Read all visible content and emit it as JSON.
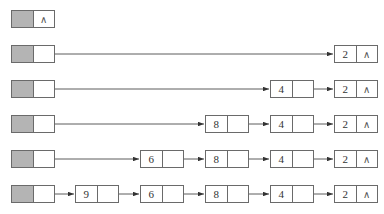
{
  "diagram": {
    "type": "linked-list-insertion-sequence",
    "null_symbol": "∧",
    "colors": {
      "head_fill": "#b4b4b4",
      "border": "#6a6a6a",
      "arrow": "#333333"
    },
    "rows": [
      {
        "nodes": []
      },
      {
        "nodes": [
          "2"
        ]
      },
      {
        "nodes": [
          "4",
          "2"
        ]
      },
      {
        "nodes": [
          "8",
          "4",
          "2"
        ]
      },
      {
        "nodes": [
          "6",
          "8",
          "4",
          "2"
        ]
      },
      {
        "nodes": [
          "9",
          "6",
          "8",
          "4",
          "2"
        ]
      }
    ]
  },
  "labels": {
    "r0": {
      "head_nil": "∧"
    },
    "r1": {
      "n0": "2",
      "n0_nil": "∧"
    },
    "r2": {
      "n0": "4",
      "n1": "2",
      "n1_nil": "∧"
    },
    "r3": {
      "n0": "8",
      "n1": "4",
      "n2": "2",
      "n2_nil": "∧"
    },
    "r4": {
      "n0": "6",
      "n1": "8",
      "n2": "4",
      "n3": "2",
      "n3_nil": "∧"
    },
    "r5": {
      "n0": "9",
      "n1": "6",
      "n2": "8",
      "n3": "4",
      "n4": "2",
      "n4_nil": "∧"
    }
  }
}
